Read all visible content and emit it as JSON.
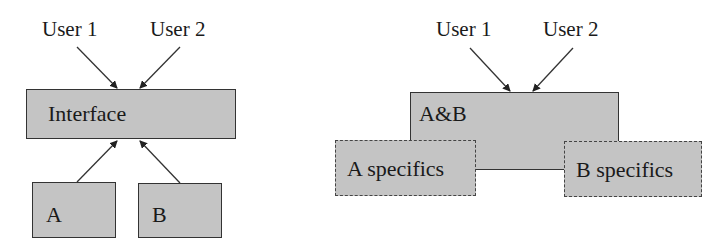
{
  "left_diagram": {
    "users": [
      {
        "label": "User 1"
      },
      {
        "label": "User 2"
      }
    ],
    "interface": {
      "label": "Interface"
    },
    "components": [
      {
        "label": "A"
      },
      {
        "label": "B"
      }
    ]
  },
  "right_diagram": {
    "users": [
      {
        "label": "User 1"
      },
      {
        "label": "User 2"
      }
    ],
    "shared": {
      "label": "A&B"
    },
    "specifics": [
      {
        "label": "A specifics"
      },
      {
        "label": "B specifics"
      }
    ]
  },
  "colors": {
    "box_fill": "#c4c4c4",
    "border": "#333333",
    "text": "#1a1a1a"
  }
}
